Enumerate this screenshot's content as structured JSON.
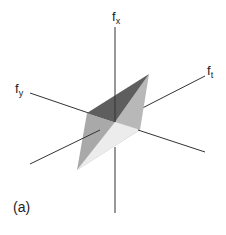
{
  "figure": {
    "panel_label": "(a)",
    "axes": {
      "x": {
        "base": "f",
        "sub": "x"
      },
      "y": {
        "base": "f",
        "sub": "y"
      },
      "t": {
        "base": "f",
        "sub": "t"
      }
    },
    "colors": {
      "axis": "#333333",
      "face_dark": "#5e5e5e",
      "face_mid": "#a9a9a9",
      "face_right": "#b8b8b8",
      "face_light": "#ececec"
    }
  }
}
